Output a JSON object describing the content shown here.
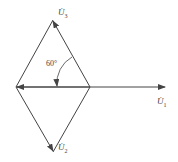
{
  "diagram": {
    "type": "phasor",
    "labels": {
      "u3": {
        "base": "U̇",
        "sub": "3"
      },
      "u1": {
        "base": "U̇",
        "sub": "1"
      },
      "u2": {
        "base": "U̇",
        "sub": "2"
      }
    },
    "angle_label": "60°",
    "stroke_color": "#444444"
  }
}
